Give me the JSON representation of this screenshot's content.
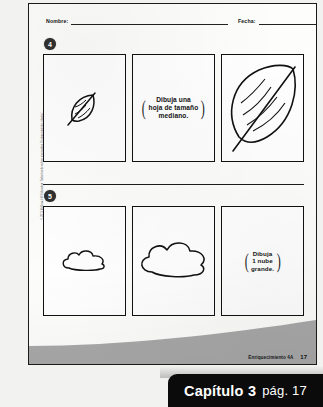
{
  "worksheet": {
    "header": {
      "name_label": "Nombre:",
      "name_value": "",
      "date_label": "Fecha:",
      "date_value": ""
    },
    "exercises": [
      {
        "number": "4",
        "panels": [
          {
            "kind": "drawing",
            "icon": "small-leaf-icon",
            "text": ""
          },
          {
            "kind": "instruction",
            "icon": "",
            "text": "Dibuja una\nhoja de tamaño\nmediano."
          },
          {
            "kind": "drawing",
            "icon": "large-leaf-icon",
            "text": ""
          }
        ]
      },
      {
        "number": "5",
        "panels": [
          {
            "kind": "drawing",
            "icon": "small-cloud-icon",
            "text": ""
          },
          {
            "kind": "drawing",
            "icon": "medium-cloud-icon",
            "text": ""
          },
          {
            "kind": "instruction",
            "icon": "",
            "text": "Dibuja\n1 nube\ngrande."
          }
        ]
      }
    ],
    "copyright": "© 2013 McGraw-Hill Education. Todos los derechos reservados. Enriquecimiento, página 1",
    "footer": {
      "label": "Enriquecimiento 4A",
      "page": "17"
    }
  },
  "caption": {
    "chapter": "Capítulo 3",
    "page": "pág. 17"
  },
  "colors": {
    "ink": "#111111",
    "caption_bg": "#0b0b0b",
    "swoosh": "#a8a8a8",
    "badge_bg": "#303030"
  }
}
